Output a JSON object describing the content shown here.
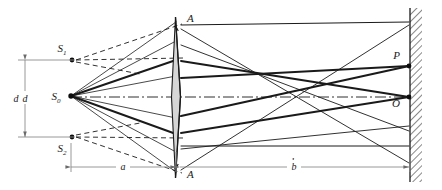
{
  "figure": {
    "type": "optics-ray-diagram",
    "name": "Fresnel biprism interference",
    "width": 442,
    "height": 190,
    "background_color": "#ffffff",
    "ray_color": "#1a1a1a",
    "dim_color": "#8c8c8c",
    "prism_fill": "#d6d6d6",
    "screen_hatch_color": "#6b6b6b"
  },
  "labels": {
    "source_real": "S",
    "source_real_sub": "0",
    "virtual_top": "S",
    "virtual_top_sub": "1",
    "virtual_bottom": "S",
    "virtual_bottom_sub": "2",
    "prism_vertex_top": "A",
    "prism_vertex_bottom": "A",
    "screen_point_fringe": "P",
    "screen_point_center": "O",
    "dim_separation": "d",
    "dim_source_to_prism": "a",
    "dim_prism_to_screen": "b"
  },
  "geometry": {
    "axis_y": 97,
    "source_x": 71,
    "source_y": 96,
    "virtual_top_x": 71,
    "virtual_top_y": 60,
    "virtual_bottom_x": 71,
    "virtual_bottom_y": 137,
    "prism_x": 178,
    "prism_top_y": 17,
    "prism_bottom_y": 178,
    "screen_x": 410,
    "screen_top_y": 8,
    "screen_bottom_y": 182,
    "point_p_y": 66,
    "point_o_y": 97,
    "dim_d_x": 25,
    "dim_baseline_y": 167
  }
}
